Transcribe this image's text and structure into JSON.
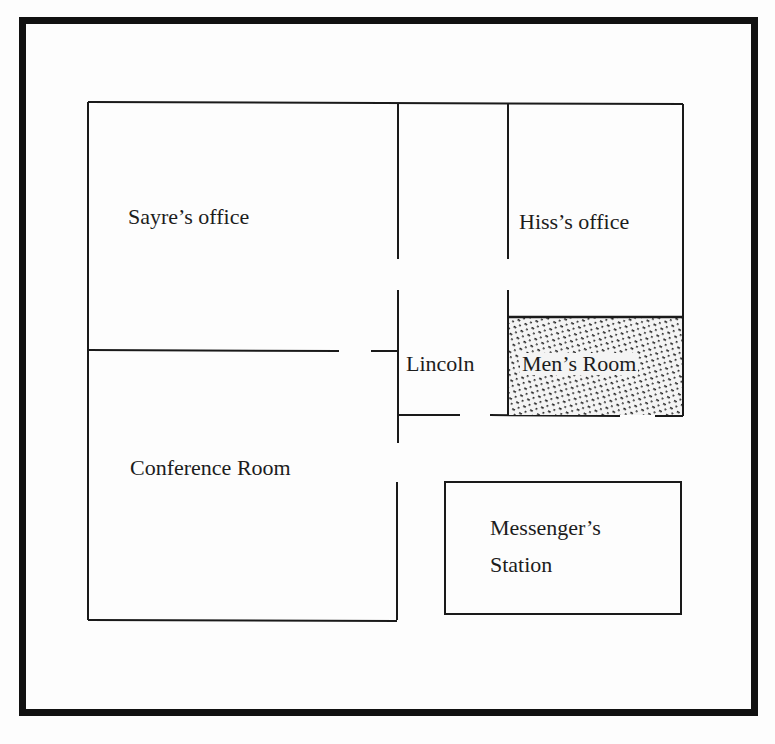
{
  "diagram": {
    "type": "floor-plan",
    "rooms": [
      {
        "id": "sayre",
        "label": "Sayre’s office"
      },
      {
        "id": "hiss",
        "label": "Hiss’s office"
      },
      {
        "id": "lincoln",
        "label": "Lincoln"
      },
      {
        "id": "mens",
        "label": "Men’s Room"
      },
      {
        "id": "conference",
        "label": "Conference Room"
      },
      {
        "id": "messenger_line1",
        "label": "Messenger’s"
      },
      {
        "id": "messenger_line2",
        "label": "Station"
      }
    ],
    "colors": {
      "line": "#1a1a1a",
      "background": "#fdfdfd"
    }
  }
}
